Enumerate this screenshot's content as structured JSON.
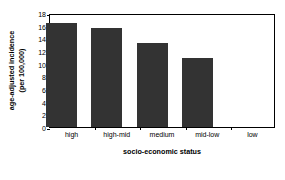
{
  "chart_data": {
    "type": "bar",
    "title": "",
    "xlabel": "socio-economic status",
    "ylabel_line1": "age-adjusted incidence",
    "ylabel_line2": "(per 100,000)",
    "categories": [
      "high",
      "high-mid",
      "medium",
      "mid-low",
      "low"
    ],
    "values": [
      16.5,
      15.6,
      13.3,
      10.9,
      0
    ],
    "series": [
      {
        "name": "age-adjusted incidence",
        "values": [
          16.5,
          15.6,
          13.3,
          10.9,
          0
        ]
      }
    ],
    "ylim": [
      0,
      18
    ],
    "ytick_values": [
      0,
      2,
      4,
      6,
      8,
      10,
      12,
      14,
      16,
      18
    ],
    "ytick_labels": [
      "0",
      "2",
      "4",
      "6",
      "8",
      "10",
      "12",
      "14",
      "16",
      "18"
    ],
    "grid": false,
    "legend": null,
    "legend_position": "none",
    "bar_color": "#333333",
    "frame_color": "#000000",
    "background_color": "#ffffff",
    "annotations": []
  }
}
